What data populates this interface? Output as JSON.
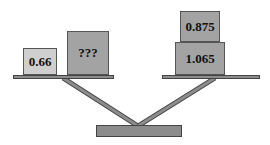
{
  "diagram": {
    "type": "balance-scale",
    "left_pan": {
      "weights": [
        {
          "label": "0.66",
          "color": "#cfcfcf"
        },
        {
          "label": "???",
          "color": "#a3a3a3"
        }
      ]
    },
    "right_pan": {
      "weights": [
        {
          "label": "0.875",
          "color": "#a3a3a3"
        },
        {
          "label": "1.065",
          "color": "#a3a3a3"
        }
      ]
    },
    "colors": {
      "beam": "#8c8c8c",
      "outline": "#444444",
      "background": "#ffffff"
    }
  }
}
